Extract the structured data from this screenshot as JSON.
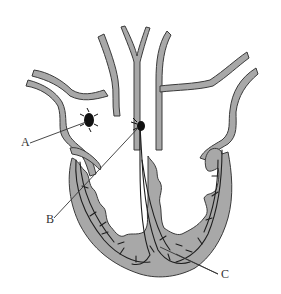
{
  "diagram": {
    "colors": {
      "tissue_fill": "#a8a8a8",
      "outline": "#3a3a3a",
      "conduction_fibers": "#1e1e1e",
      "nodes": "#111111",
      "leader_lines": "#333333",
      "background": "#ffffff"
    },
    "labels": [
      {
        "id": "A",
        "text": "A",
        "points_to": "node in right atrium wall"
      },
      {
        "id": "B",
        "text": "B",
        "points_to": "node at atrial septum"
      },
      {
        "id": "C",
        "text": "C",
        "points_to": "fibers in ventricle wall near apex"
      }
    ]
  }
}
